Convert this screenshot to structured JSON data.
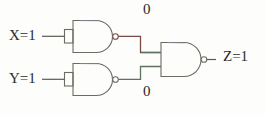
{
  "diagram": {
    "background_color": "#fdfdfc",
    "wire_color": "#5a5a52",
    "gate_outline_color": "#6b6b63",
    "highlight_wire_color": "#7a4a48",
    "inputs": [
      {
        "id": "x",
        "label": "X=1",
        "signal": "X",
        "value": "1"
      },
      {
        "id": "y",
        "label": "Y=1",
        "signal": "Y",
        "value": "1"
      }
    ],
    "outputs": [
      {
        "id": "z",
        "label": "Z=1",
        "signal": "Z",
        "value": "1"
      }
    ],
    "intermediate_values": [
      {
        "id": "n1",
        "label": "0",
        "position": "top"
      },
      {
        "id": "n2",
        "label": "0",
        "position": "bottom"
      }
    ],
    "gates": [
      {
        "id": "gate1",
        "type": "NAND",
        "inputs_tied": true,
        "role": "inverter-x"
      },
      {
        "id": "gate2",
        "type": "NAND",
        "inputs_tied": true,
        "role": "inverter-y"
      },
      {
        "id": "gate3",
        "type": "NAND",
        "inputs_tied": false,
        "role": "output-nand"
      }
    ]
  }
}
